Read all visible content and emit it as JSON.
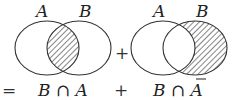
{
  "diagrams": [
    {
      "id": "left",
      "set_labels": [
        "A",
        "B"
      ],
      "shaded_region": "intersection",
      "circles": {
        "a": {
          "cx": 47,
          "cy": 48,
          "rx": 32,
          "ry": 27
        },
        "b": {
          "cx": 79,
          "cy": 48,
          "rx": 32,
          "ry": 27
        }
      }
    },
    {
      "id": "right",
      "set_labels": [
        "A",
        "B"
      ],
      "shaded_region": "B minus A",
      "circles": {
        "a": {
          "cx": 163,
          "cy": 48,
          "rx": 32,
          "ry": 27
        },
        "b": {
          "cx": 195,
          "cy": 48,
          "rx": 32,
          "ry": 27
        }
      }
    }
  ],
  "plus_between_diagrams": "+",
  "equation": {
    "equals": "=",
    "term1": "B ∩ A",
    "plus": "+",
    "term2_prefix": "B ∩ ",
    "term2_set": "A",
    "term2_bar": "¯"
  },
  "colors": {
    "stroke": "#333333",
    "hatch": "#444444",
    "background": "#ffffff"
  }
}
